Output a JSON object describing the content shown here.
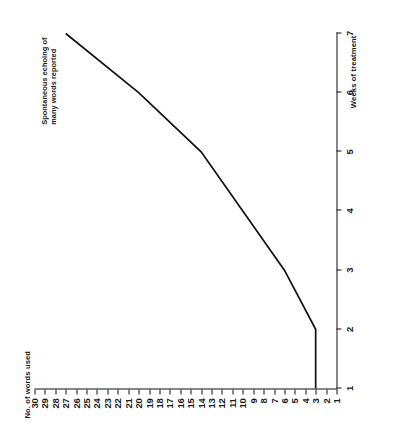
{
  "figure": {
    "rotation_note": "sideways",
    "background_color": "#ffffff",
    "line_color": "#111111"
  },
  "labels": {
    "y_axis_title": "No. of words used",
    "x_axis_title": "Weeks of treatment",
    "annotation_line1": "Spontaneous echoing of",
    "annotation_line2": "many words reported"
  },
  "chart_data": {
    "type": "line",
    "title": "",
    "subtitle": "",
    "xlabel": "Weeks of treatment",
    "ylabel": "No. of words used",
    "x": [
      1,
      2,
      3,
      4,
      5,
      6,
      7
    ],
    "values": [
      3,
      3,
      6,
      10,
      14,
      20,
      27
    ],
    "series": [
      {
        "name": "No. of words used",
        "values": [
          3,
          3,
          6,
          10,
          14,
          20,
          27
        ]
      }
    ],
    "xlim": [
      1,
      7
    ],
    "ylim": [
      1,
      30
    ],
    "xticks": [
      1,
      2,
      3,
      4,
      5,
      6,
      7
    ],
    "xticklabels": [
      "1",
      "2",
      "3",
      "4",
      "5",
      "6",
      "7"
    ],
    "yticks": [
      1,
      2,
      3,
      4,
      5,
      6,
      7,
      8,
      9,
      10,
      11,
      12,
      13,
      14,
      15,
      16,
      17,
      18,
      19,
      20,
      21,
      22,
      23,
      24,
      25,
      26,
      27,
      28,
      29,
      30
    ],
    "yticklabels": [
      "1",
      "2",
      "3",
      "4",
      "5",
      "6",
      "7",
      "8",
      "9",
      "10",
      "11",
      "12",
      "13",
      "14",
      "15",
      "16",
      "17",
      "18",
      "19",
      "20",
      "21",
      "22",
      "23",
      "24",
      "25",
      "26",
      "27",
      "28",
      "29",
      "30"
    ],
    "grid": false,
    "legend": false,
    "legend_position": "none",
    "annotations": [
      {
        "text": "Spontaneous echoing of many words reported",
        "x": 7,
        "y": 27
      }
    ]
  }
}
